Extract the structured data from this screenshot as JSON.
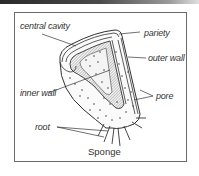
{
  "diagram": {
    "title": "Sponge",
    "labels": {
      "central_cavity": "central cavity",
      "pariety": "pariety",
      "outer_wall": "outer wall",
      "inner_wall": "inner wall",
      "pore": "pore",
      "root": "root"
    },
    "colors": {
      "line": "#333333",
      "frame": "#6a6a6a",
      "background": "#ffffff"
    }
  }
}
